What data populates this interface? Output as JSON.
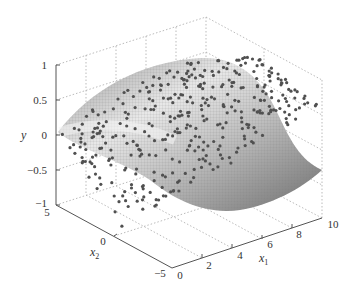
{
  "chart_data": {
    "type": "scatter3d_surface",
    "title": "",
    "xlabel": "x1",
    "ylabel": "x2",
    "zlabel": "y",
    "x1_ticks": [
      "0",
      "2",
      "4",
      "6",
      "8",
      "10"
    ],
    "x2_ticks": [
      "-5",
      "0",
      "5"
    ],
    "y_ticks": [
      "-1",
      "-0.5",
      "0",
      "0.5",
      "1"
    ],
    "x1_range": [
      0,
      10
    ],
    "x2_range": [
      -5,
      5
    ],
    "y_range": [
      -1,
      1
    ],
    "grid": true,
    "surface": "y = sin(x1) * cos-like sheet over x1 in [0,10], x2 in [-5,5], mesh rendered in grayscale",
    "scatter": "noisy samples (dark gray markers) scattered on/around the surface, roughly 400 points",
    "colors": {
      "surface_light": "#f2f2f2",
      "surface_dark": "#6e6e6e",
      "points": "#555555",
      "axis": "#555555",
      "grid": "#bbbbbb"
    }
  },
  "labels": {
    "y": "y",
    "x1_base": "x",
    "x1_sub": "1",
    "x2_base": "x",
    "x2_sub": "2",
    "zt1": "1",
    "zt05": "0.5",
    "zt0": "0",
    "ztm05": "−0.5",
    "ztm1": "−1",
    "x2t5": "5",
    "x2t0": "0",
    "x2tm5": "−5",
    "x1t0": "0",
    "x1t2": "2",
    "x1t4": "4",
    "x1t6": "6",
    "x1t8": "8",
    "x1t10": "10"
  }
}
